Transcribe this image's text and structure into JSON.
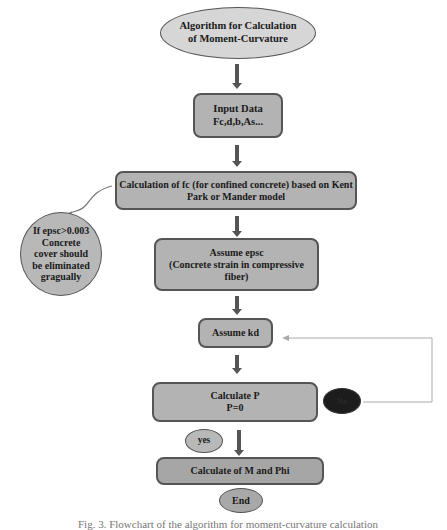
{
  "diagram": {
    "type": "flowchart",
    "colors": {
      "box_fill": "#b3b3b3",
      "ellipse_fill": "#d0d0d0",
      "dark_fill": "#1c1c1c",
      "border": "#555555",
      "arrow": "#555555",
      "feedback_line": "#aaaaaa"
    },
    "nodes": {
      "start": {
        "shape": "ellipse",
        "line1": "Algorithm for Calculation",
        "line2": "of Moment-Curvature"
      },
      "input": {
        "shape": "rounded-rect",
        "line1": "Input Data",
        "line2": "Fc,d,b,As..."
      },
      "calc_fc": {
        "shape": "rounded-rect",
        "line1": "Calculation of fc (for confined concrete) based on Kent",
        "line2": "Park or Mander model"
      },
      "note": {
        "shape": "circle",
        "line1": "If epsc>0.003",
        "line2": "Concrete",
        "line3": "cover should",
        "line4": "be eliminated",
        "line5": "gragually"
      },
      "assume_epsc": {
        "shape": "rounded-rect",
        "line1": "Assume epsc",
        "line2": "(Concrete strain in compressive",
        "line3": "fiber)"
      },
      "assume_kd": {
        "shape": "rounded-rect",
        "line1": "Assume kd"
      },
      "calc_p": {
        "shape": "rounded-rect",
        "line1": "Calculate P",
        "line2": "P=0"
      },
      "no": {
        "shape": "ellipse-dark",
        "label": "No"
      },
      "yes": {
        "shape": "ellipse",
        "label": "yes"
      },
      "calc_m_phi": {
        "shape": "rounded-rect",
        "line1": "Calculate of M and Phi"
      },
      "end": {
        "shape": "ellipse",
        "label": "End"
      }
    },
    "edges": [
      {
        "from": "start",
        "to": "input"
      },
      {
        "from": "input",
        "to": "calc_fc"
      },
      {
        "from": "calc_fc",
        "to": "note",
        "style": "curved"
      },
      {
        "from": "calc_fc",
        "to": "assume_epsc"
      },
      {
        "from": "assume_epsc",
        "to": "assume_kd"
      },
      {
        "from": "assume_kd",
        "to": "calc_p"
      },
      {
        "from": "calc_p",
        "to": "assume_kd",
        "label": "No",
        "style": "feedback"
      },
      {
        "from": "calc_p",
        "to": "calc_m_phi",
        "label": "yes"
      }
    ],
    "caption": "Fig. 3. Flowchart of the algorithm for moment-curvature calculation"
  }
}
